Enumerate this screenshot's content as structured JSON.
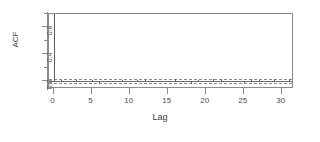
{
  "chart_data": {
    "type": "bar",
    "title": "",
    "subtitle": "",
    "xlabel": "Lag",
    "ylabel": "ACF",
    "xlim": [
      -0.6,
      31.6
    ],
    "ylim": [
      -0.12,
      1.0
    ],
    "xticks": [
      0,
      5,
      10,
      15,
      20,
      25,
      30
    ],
    "xticklabels": [
      "0",
      "5",
      "10",
      "15",
      "20",
      "25",
      "30"
    ],
    "yticks": [
      0.0,
      0.2,
      0.4,
      0.6,
      0.8,
      1.0
    ],
    "yticklabels_shown": [
      "0.0",
      "0.4",
      "0.8"
    ],
    "yticks_labeled": [
      0.0,
      0.4,
      0.8
    ],
    "grid": false,
    "legend": false,
    "annotations": [
      {
        "name": "upper-confidence-band",
        "value": 0.035,
        "style": "dashed"
      },
      {
        "name": "lower-confidence-band",
        "value": -0.035,
        "style": "dashed"
      },
      {
        "name": "zero-line",
        "value": 0.0,
        "style": "solid"
      }
    ],
    "series_name": "ACF",
    "x": [
      0,
      1,
      2,
      3,
      4,
      5,
      6,
      7,
      8,
      9,
      10,
      11,
      12,
      13,
      14,
      15,
      16,
      17,
      18,
      19,
      20,
      21,
      22,
      23,
      24,
      25,
      26,
      27,
      28,
      29,
      30,
      31
    ],
    "values": [
      1.0,
      0.012,
      -0.018,
      0.008,
      -0.006,
      0.014,
      -0.03,
      0.006,
      -0.01,
      0.016,
      -0.008,
      0.01,
      0.03,
      -0.012,
      0.006,
      -0.016,
      0.034,
      -0.006,
      -0.046,
      0.01,
      -0.014,
      0.024,
      0.032,
      -0.012,
      0.006,
      -0.034,
      0.028,
      0.01,
      -0.008,
      0.03,
      -0.012,
      0.026
    ]
  },
  "chart": {
    "y_axis_title": "ACF",
    "x_axis_title": "Lag",
    "colors": {
      "spike": "#5c5c5c",
      "axis": "#8a8a8a",
      "confidence": "#8a8a8a",
      "text": "#3c3c3c",
      "background": "#ffffff"
    }
  }
}
